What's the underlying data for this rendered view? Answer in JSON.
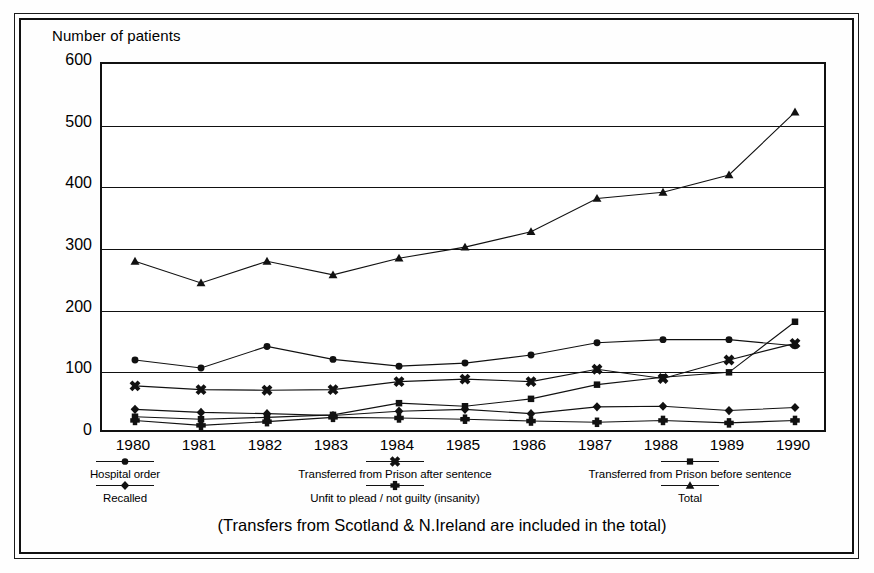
{
  "chart_data": {
    "type": "line",
    "title": "",
    "xlabel": "",
    "ylabel": "Number of patients",
    "categories": [
      "1980",
      "1981",
      "1982",
      "1983",
      "1984",
      "1985",
      "1986",
      "1987",
      "1988",
      "1989",
      "1990"
    ],
    "ylim": [
      0,
      600
    ],
    "yticks": [
      0,
      100,
      200,
      300,
      400,
      500,
      600
    ],
    "grid": true,
    "legend_position": "below",
    "annotation": "(Transfers from Scotland & N.Ireland are included in the total)",
    "series": [
      {
        "name": "Hospital order",
        "marker": "circle",
        "values": [
          120,
          107,
          142,
          121,
          110,
          115,
          128,
          148,
          153,
          153,
          143
        ]
      },
      {
        "name": "Transferred from Prison after sentence",
        "marker": "x",
        "values": [
          78,
          72,
          71,
          72,
          85,
          89,
          85,
          105,
          90,
          120,
          147
        ]
      },
      {
        "name": "Transferred from Prison before sentence",
        "marker": "square",
        "values": [
          28,
          24,
          27,
          31,
          50,
          45,
          57,
          80,
          92,
          100,
          182
        ]
      },
      {
        "name": "Recalled",
        "marker": "diamond",
        "values": [
          40,
          35,
          33,
          30,
          37,
          40,
          33,
          44,
          45,
          38,
          43
        ]
      },
      {
        "name": "Unfit to plead / not guilty (insanity)",
        "marker": "plus",
        "values": [
          22,
          14,
          20,
          27,
          26,
          24,
          21,
          19,
          22,
          18,
          22
        ]
      },
      {
        "name": "Total",
        "marker": "triangle",
        "values": [
          280,
          245,
          280,
          258,
          285,
          303,
          328,
          382,
          392,
          420,
          522
        ]
      }
    ]
  },
  "legend": {
    "items": [
      {
        "label": "Hospital order",
        "marker": "circle"
      },
      {
        "label": "Recalled",
        "marker": "diamond"
      },
      {
        "label": "Transferred from Prison after sentence",
        "marker": "x"
      },
      {
        "label": "Unfit to plead / not guilty (insanity)",
        "marker": "plus"
      },
      {
        "label": "Transferred from Prison before sentence",
        "marker": "square"
      },
      {
        "label": "Total",
        "marker": "triangle"
      }
    ]
  },
  "colors": {
    "ink": "#111111",
    "background": "#ffffff"
  }
}
